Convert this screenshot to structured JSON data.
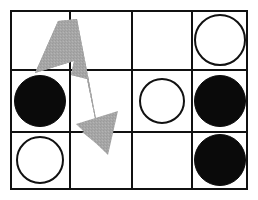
{
  "figure": {
    "kind": "grid-board-with-move-arrow",
    "background_color": "#ffffff",
    "border_color": "#111111",
    "grid": {
      "columns": 4,
      "rows": 3,
      "line_color": "#111111",
      "outer_border_width": 2,
      "inner_line_width": 2,
      "origin_x": 10,
      "origin_y": 10,
      "width": 238,
      "height": 180,
      "column_edges": [
        0,
        60,
        122,
        182,
        238
      ],
      "row_edges": [
        0,
        60,
        122,
        180
      ]
    },
    "piece_colors": {
      "black_fill": "#0a0a0a",
      "white_fill": "#ffffff",
      "white_outline": "#111111"
    },
    "arrow": {
      "name": "u-turn-move-arrow",
      "fill_color": "#a6a6a6",
      "style": "textured-gray",
      "description": "Bent two-headed arrow: upper head points up-left, shaft folds down and the lower head points down-right",
      "upper_head_direction": "up",
      "lower_head_direction": "down",
      "spans_columns": [
        1,
        2
      ],
      "spans_rows": [
        1,
        3
      ]
    },
    "cells": [
      {
        "row": 1,
        "column": 1,
        "content": "empty",
        "label": "r1c1-empty"
      },
      {
        "row": 1,
        "column": 2,
        "content": "empty",
        "label": "r1c2-empty"
      },
      {
        "row": 1,
        "column": 3,
        "content": "empty",
        "label": "r1c3-empty"
      },
      {
        "row": 1,
        "column": 4,
        "content": "white-circle",
        "label": "r1c4-white-circle"
      },
      {
        "row": 2,
        "column": 1,
        "content": "black-circle",
        "label": "r2c1-black-circle"
      },
      {
        "row": 2,
        "column": 2,
        "content": "empty",
        "label": "r2c2-empty"
      },
      {
        "row": 2,
        "column": 3,
        "content": "white-circle",
        "label": "r2c3-white-circle"
      },
      {
        "row": 2,
        "column": 4,
        "content": "black-circle",
        "label": "r2c4-black-circle"
      },
      {
        "row": 3,
        "column": 1,
        "content": "white-circle",
        "label": "r3c1-white-circle"
      },
      {
        "row": 3,
        "column": 2,
        "content": "empty",
        "label": "r3c2-empty"
      },
      {
        "row": 3,
        "column": 3,
        "content": "empty",
        "label": "r3c3-empty"
      },
      {
        "row": 3,
        "column": 4,
        "content": "black-circle",
        "label": "r3c4-black-circle"
      }
    ],
    "pieces": [
      {
        "name": "white-circle-r1c4",
        "type": "white-circle",
        "cx": 210,
        "cy": 30,
        "r": 26
      },
      {
        "name": "black-circle-r2c1",
        "type": "black-circle",
        "cx": 30,
        "cy": 91,
        "r": 26
      },
      {
        "name": "white-circle-r2c3",
        "type": "white-circle",
        "cx": 152,
        "cy": 91,
        "r": 23
      },
      {
        "name": "black-circle-r2c4",
        "type": "black-circle",
        "cx": 210,
        "cy": 91,
        "r": 26
      },
      {
        "name": "white-circle-r3c1",
        "type": "white-circle",
        "cx": 30,
        "cy": 150,
        "r": 24
      },
      {
        "name": "black-circle-r3c4",
        "type": "black-circle",
        "cx": 210,
        "cy": 150,
        "r": 26
      }
    ]
  }
}
